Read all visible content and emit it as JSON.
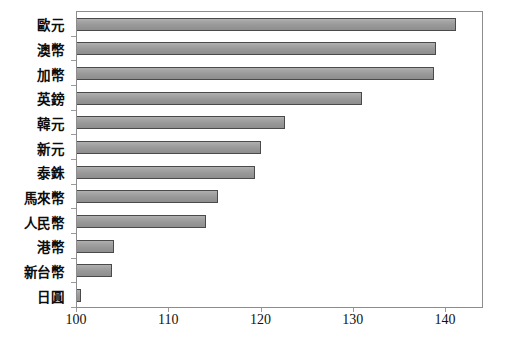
{
  "chart_data": {
    "type": "bar",
    "orientation": "horizontal",
    "title": "",
    "subtitle": "",
    "xlabel": "",
    "ylabel": "",
    "categories": [
      "歐元",
      "澳幣",
      "加幣",
      "英鎊",
      "韓元",
      "新元",
      "泰銖",
      "馬來幣",
      "人民幣",
      "港幣",
      "新台幣",
      "日圓"
    ],
    "values": [
      141.1,
      138.9,
      138.7,
      130.9,
      122.6,
      119.9,
      119.3,
      115.3,
      114.0,
      104.0,
      103.8,
      100.4
    ],
    "series": [
      {
        "name": "",
        "values": [
          141.1,
          138.9,
          138.7,
          130.9,
          122.6,
          119.9,
          119.3,
          115.3,
          114.0,
          104.0,
          103.8,
          100.4
        ]
      }
    ],
    "xlim": [
      100,
      143.9
    ],
    "xticks": [
      100,
      110,
      120,
      130,
      140
    ],
    "xtick_labels": [
      "100",
      "110",
      "120",
      "130",
      "140"
    ],
    "grid": false,
    "legend": false,
    "legend_position": "none",
    "bar_fill_color": "#9d9d9d",
    "bar_border_color": "#4a4a4a",
    "frame_color": "#8d8d8d",
    "background_color": "#ffffff"
  }
}
